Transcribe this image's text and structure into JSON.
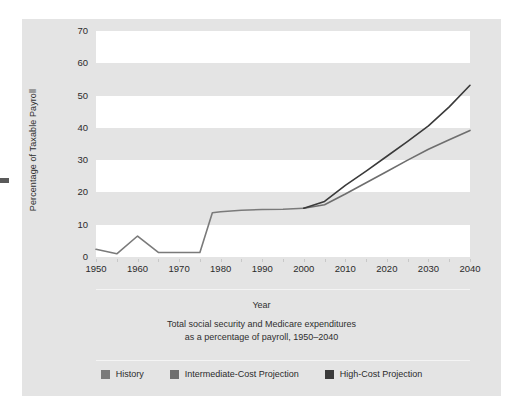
{
  "figure": {
    "panel_color": "#e4e4e4",
    "plot_band_white": "#ffffff",
    "plot_band_gray": "#e4e4e4"
  },
  "x_axis_label": "Year",
  "caption_line1": "Total social security and Medicare expenditures",
  "caption_line2": "as a percentage of payroll, 1950–2040",
  "legend": {
    "items": [
      {
        "label": "History",
        "color": "#7a7a7a"
      },
      {
        "label": "Intermediate-Cost Projection",
        "color": "#6e6e6e"
      },
      {
        "label": "High-Cost Projection",
        "color": "#3a3a3a"
      }
    ]
  },
  "chart_data": {
    "type": "line",
    "title": "Total social security and Medicare expenditures as a percentage of payroll, 1950–2040",
    "xlabel": "Year",
    "ylabel": "Percentage of Taxable Payroll",
    "xlim": [
      1950,
      2040
    ],
    "ylim": [
      0,
      70
    ],
    "xticks": [
      1950,
      1960,
      1970,
      1980,
      1990,
      2000,
      2010,
      2020,
      2030,
      2040
    ],
    "yticks": [
      0,
      10,
      20,
      30,
      40,
      50,
      60,
      70
    ],
    "grid": false,
    "banded_background": true,
    "legend_position": "bottom",
    "series": [
      {
        "name": "History",
        "color": "#7a7a7a",
        "x": [
          1950,
          1955,
          1960,
          1965,
          1970,
          1975,
          1978,
          1980,
          1985,
          1990,
          1995,
          2000
        ],
        "values": [
          2.4,
          1.0,
          6.5,
          1.4,
          1.4,
          1.4,
          13.7,
          14.0,
          14.5,
          14.7,
          14.8,
          15.1
        ]
      },
      {
        "name": "Intermediate-Cost Projection",
        "color": "#6e6e6e",
        "x": [
          2000,
          2005,
          2010,
          2015,
          2020,
          2025,
          2030,
          2035,
          2040
        ],
        "values": [
          15.1,
          16.2,
          19.5,
          23.0,
          26.5,
          30.0,
          33.4,
          36.3,
          39.2
        ]
      },
      {
        "name": "High-Cost Projection",
        "color": "#3a3a3a",
        "x": [
          2000,
          2005,
          2010,
          2015,
          2020,
          2025,
          2030,
          2035,
          2040
        ],
        "values": [
          15.1,
          17.2,
          22.2,
          26.6,
          31.2,
          35.8,
          40.6,
          46.5,
          53.2
        ]
      }
    ]
  }
}
